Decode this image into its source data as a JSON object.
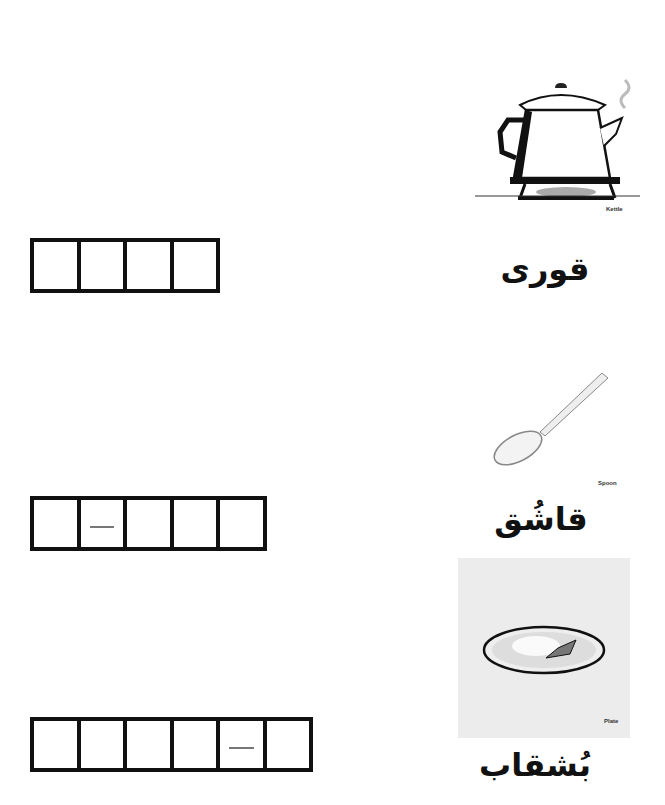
{
  "worksheet": {
    "items": [
      {
        "picture": "kettle-image",
        "caption": "Kettle",
        "word": "قوری",
        "box_count": 4,
        "dash_cells": []
      },
      {
        "picture": "spoon-image",
        "caption": "Spoon",
        "word": "قاشُق",
        "box_count": 5,
        "dash_cells": [
          2
        ]
      },
      {
        "picture": "plate-image",
        "caption": "Plate",
        "word": "بُشقاب",
        "box_count": 6,
        "dash_cells": [
          5
        ]
      }
    ]
  },
  "colors": {
    "ink": "#111111",
    "plate_background": "#ececec"
  }
}
